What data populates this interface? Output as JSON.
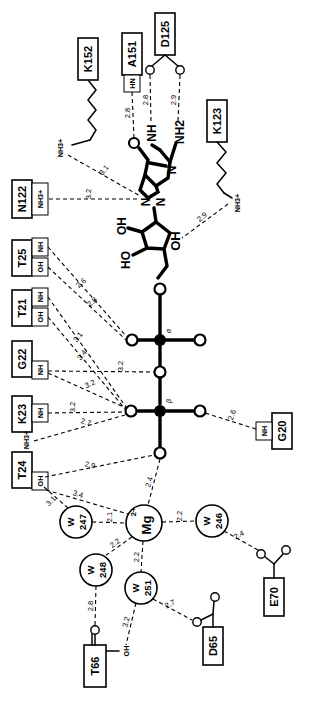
{
  "diagram": {
    "type": "ligand-interaction-plot",
    "ligand": "nucleotide-diphosphate-magnesium",
    "orientation_note": "labels rotated 90 degrees",
    "colors": {
      "ink": "#000000",
      "background": "#ffffff"
    }
  },
  "residues": [
    {
      "id": "K152",
      "label": "K152",
      "groups": [
        "NH3+"
      ]
    },
    {
      "id": "A151",
      "label": "A151",
      "groups": [
        "HN"
      ]
    },
    {
      "id": "D125",
      "label": "D125",
      "groups": [
        "O",
        "O"
      ]
    },
    {
      "id": "K123",
      "label": "K123",
      "groups": [
        "NH3+"
      ]
    },
    {
      "id": "N122",
      "label": "N122",
      "groups": [
        "NH3+"
      ]
    },
    {
      "id": "T25",
      "label": "T25",
      "groups": [
        "NH",
        "OH"
      ]
    },
    {
      "id": "T21",
      "label": "T21",
      "groups": [
        "NH",
        "OH"
      ]
    },
    {
      "id": "G22",
      "label": "G22",
      "groups": [
        "NH"
      ]
    },
    {
      "id": "K23",
      "label": "K23",
      "groups": [
        "NH",
        "NH3+"
      ]
    },
    {
      "id": "T24",
      "label": "T24",
      "groups": [
        "OH"
      ]
    },
    {
      "id": "G20",
      "label": "G20",
      "groups": [
        "NH"
      ]
    },
    {
      "id": "E70",
      "label": "E70",
      "groups": [
        "O",
        "O"
      ]
    },
    {
      "id": "D65",
      "label": "D65",
      "groups": [
        "O",
        "O"
      ]
    },
    {
      "id": "T66",
      "label": "T66",
      "groups": [
        "O",
        "OH"
      ]
    }
  ],
  "waters": [
    {
      "id": "W247",
      "line1": "W",
      "line2": "247"
    },
    {
      "id": "W246",
      "line1": "W",
      "line2": "246"
    },
    {
      "id": "W248",
      "line1": "W",
      "line2": "248"
    },
    {
      "id": "W251",
      "line1": "W",
      "line2": "251"
    }
  ],
  "metal": {
    "label": "Mg",
    "charge": "2+"
  },
  "ligand_atoms": {
    "nh_label": "NH",
    "nh2_label": "NH2",
    "oh_label_1": "OH",
    "oh_label_2": "HO",
    "n_label": "N",
    "phosphorus_label": "P",
    "greek_alpha": "α",
    "greek_beta": "β"
  },
  "distances": [
    {
      "value": "2.8",
      "from": "A151 HN",
      "to": "ligand O"
    },
    {
      "value": "2.8",
      "from": "D125 O",
      "to": "NH"
    },
    {
      "value": "2.9",
      "from": "D125 O",
      "to": "NH2"
    },
    {
      "value": "3.1",
      "from": "K152 NH3+",
      "to": "ring N"
    },
    {
      "value": "3.2",
      "from": "N122 NH3+",
      "to": "ring N"
    },
    {
      "value": "2.9",
      "from": "K123 NH3+",
      "to": "ribose O"
    },
    {
      "value": "2.6",
      "from": "T25 NH",
      "to": "phosphate O"
    },
    {
      "value": "2.8",
      "from": "T25 OH",
      "to": "phosphate O"
    },
    {
      "value": "3.1",
      "from": "T21 NH",
      "to": "phosphate O"
    },
    {
      "value": "3.4",
      "from": "T21 OH",
      "to": "phosphate O"
    },
    {
      "value": "3.2",
      "from": "G22 NH",
      "to": "bridging O"
    },
    {
      "value": "3.2",
      "from": "G22 NH",
      "to": "phosphate O"
    },
    {
      "value": "3.2",
      "from": "K23 NH",
      "to": "phosphate O"
    },
    {
      "value": "2.7",
      "from": "K23 NH3+",
      "to": "phosphate O"
    },
    {
      "value": "2.9",
      "from": "T24 OH",
      "to": "phosphate O"
    },
    {
      "value": "2.6",
      "from": "G20 NH",
      "to": "phosphate O"
    },
    {
      "value": "3.1",
      "from": "T24 OH",
      "to": "W247"
    },
    {
      "value": "3.4",
      "from": "T24 OH",
      "to": "W247"
    },
    {
      "value": "2.4",
      "from": "Mg2+",
      "to": "phosphate O"
    },
    {
      "value": "2.1",
      "from": "Mg2+",
      "to": "W247"
    },
    {
      "value": "2.2",
      "from": "Mg2+",
      "to": "W246"
    },
    {
      "value": "2.2",
      "from": "Mg2+",
      "to": "W248"
    },
    {
      "value": "2.2",
      "from": "Mg2+",
      "to": "W251"
    },
    {
      "value": "2.4",
      "from": "W246",
      "to": "E70 O"
    },
    {
      "value": "2.8",
      "from": "W248",
      "to": "T66 O"
    },
    {
      "value": "3.2",
      "from": "W251",
      "to": "T66 OH"
    },
    {
      "value": "2.7",
      "from": "W251",
      "to": "D65 O"
    }
  ]
}
